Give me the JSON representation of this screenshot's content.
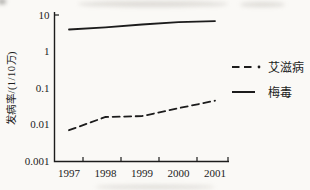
{
  "colors": {
    "ink": "#1c1c1c",
    "background": "#faf9f6"
  },
  "chart_data": {
    "type": "line",
    "title": "",
    "ylabel": "发病率/(1/10万)",
    "x": [
      1997,
      1998,
      1999,
      2000,
      2001
    ],
    "x_tick_labels": [
      "1997",
      "1998",
      "1999",
      "2000",
      "2001"
    ],
    "y_scale": "log",
    "ylim": [
      0.001,
      10
    ],
    "y_tick_values": [
      10,
      1,
      0.1,
      0.01,
      0.001
    ],
    "y_tick_labels": [
      "10",
      "1",
      "0.1",
      "0.01",
      "0.001"
    ],
    "grid": false,
    "legend_position": "right",
    "series": [
      {
        "name": "艾滋病",
        "style": "dashed",
        "values": [
          0.007,
          0.016,
          0.017,
          0.028,
          0.045
        ]
      },
      {
        "name": "梅毒",
        "style": "solid",
        "values": [
          4.0,
          4.6,
          5.5,
          6.4,
          6.8
        ]
      }
    ]
  }
}
